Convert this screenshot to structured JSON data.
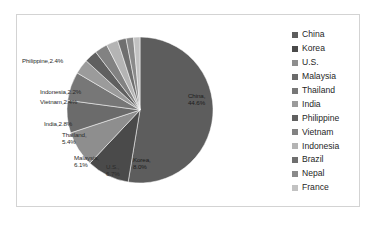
{
  "chart_data": {
    "type": "pie",
    "title": "",
    "xlabel": "",
    "ylabel": "",
    "legend_position": "right",
    "grid": false,
    "categories": [
      "China",
      "Korea",
      "U.S.",
      "Malaysia",
      "Thailand",
      "India",
      "Philippine",
      "Vietnam",
      "Indonesia",
      "Brazil",
      "Nepal",
      "France"
    ],
    "values": [
      44.6,
      8.0,
      6.7,
      6.1,
      5.4,
      2.8,
      2.4,
      2.4,
      2.2,
      1.6,
      1.4,
      1.2
    ],
    "units": "percent",
    "slice_colors": [
      "#5d5d5d",
      "#4a4a4a",
      "#8e8e8e",
      "#6b6b6b",
      "#777777",
      "#9b9b9b",
      "#606060",
      "#828282",
      "#b4b4b4",
      "#6f6f6f",
      "#8a8a8a",
      "#c2c2c2"
    ],
    "data_labels": [
      {
        "text": "China,",
        "value_text": "44.6%",
        "x": 188,
        "y": 92,
        "inside": true
      },
      {
        "text": "Korea,",
        "value_text": "8.0%",
        "x": 133,
        "y": 156,
        "inside": true
      },
      {
        "text": "U.S.,",
        "value_text": "6.7%",
        "x": 106,
        "y": 163,
        "inside": false
      },
      {
        "text": "Malaysia,",
        "value_text": "6.1%",
        "x": 74,
        "y": 154,
        "inside": false
      },
      {
        "text": "Thailand,",
        "value_text": "5.4%",
        "x": 62,
        "y": 131,
        "inside": false
      },
      {
        "text": "India,2.8%",
        "value_text": "",
        "x": 44,
        "y": 120,
        "inside": false
      },
      {
        "text": "Vietnam,2.4%",
        "value_text": "",
        "x": 40,
        "y": 98,
        "inside": false
      },
      {
        "text": "Indonesia,2.2%",
        "value_text": "",
        "x": 40,
        "y": 88,
        "inside": false
      },
      {
        "text": "Philippine,2.4%",
        "value_text": "",
        "x": 22,
        "y": 57,
        "inside": false
      }
    ]
  },
  "legend": {
    "items": [
      {
        "label": "China",
        "color": "#5d5d5d"
      },
      {
        "label": "Korea",
        "color": "#4a4a4a"
      },
      {
        "label": "U.S.",
        "color": "#8e8e8e"
      },
      {
        "label": "Malaysia",
        "color": "#6b6b6b"
      },
      {
        "label": "Thailand",
        "color": "#777777"
      },
      {
        "label": "India",
        "color": "#9b9b9b"
      },
      {
        "label": "Philippine",
        "color": "#606060"
      },
      {
        "label": "Vietnam",
        "color": "#828282"
      },
      {
        "label": "Indonesia",
        "color": "#b4b4b4"
      },
      {
        "label": "Brazil",
        "color": "#6f6f6f"
      },
      {
        "label": "Nepal",
        "color": "#8a8a8a"
      },
      {
        "label": "France",
        "color": "#c2c2c2"
      }
    ]
  },
  "frame": {
    "border_color": "#d3d3d3",
    "background": "#ffffff"
  }
}
